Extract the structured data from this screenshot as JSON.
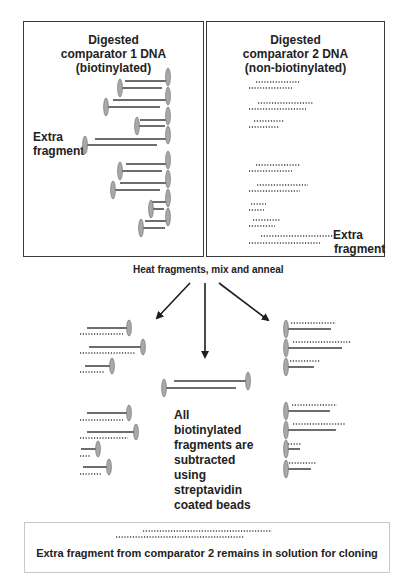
{
  "panels": {
    "left": {
      "title_lines": [
        "Digested",
        "comparator 1 DNA",
        "(biotinylated)"
      ],
      "side_label_lines": [
        "Extra",
        "fragment"
      ]
    },
    "right": {
      "title_lines": [
        "Digested",
        "comparator 2 DNA",
        "(non-biotinylated)"
      ],
      "side_label_lines": [
        "Extra",
        "fragment"
      ]
    }
  },
  "step_caption": "Heat fragments, mix and anneal",
  "subtraction_note_lines": [
    "All",
    "biotinylated",
    "fragments are",
    "subtracted",
    "using",
    "streptavidin",
    "coated beads"
  ],
  "result_caption": "Extra fragment from comparator 2 remains in solution for cloning",
  "colors": {
    "solid_strand": "#3c3c3c",
    "dotted_strand": "#444444",
    "biotin_bead": "#a8a8a8",
    "bead_outline": "#6a6a6a",
    "panel_border": "#3a3a3a",
    "result_border": "#c8c8c8",
    "arrow": "#1e1e1e"
  },
  "legend_semantics": {
    "solid_line_with_oval": "biotinylated DNA fragment (comparator 1)",
    "dotted_line": "non-biotinylated DNA fragment (comparator 2)"
  },
  "geometry": {
    "left_panel_fragments": [
      {
        "x1": 125,
        "x2": 168,
        "y": 81,
        "bead": "right"
      },
      {
        "x1": 120,
        "x2": 162,
        "y": 88,
        "bead": "left"
      },
      {
        "x1": 113,
        "x2": 168,
        "y": 100,
        "bead": "right"
      },
      {
        "x1": 106,
        "x2": 160,
        "y": 107,
        "bead": "left"
      },
      {
        "x1": 140,
        "x2": 168,
        "y": 120,
        "bead": "right"
      },
      {
        "x1": 137,
        "x2": 165,
        "y": 126,
        "bead": "left"
      },
      {
        "x1": 95,
        "x2": 168,
        "y": 139,
        "bead": "right"
      },
      {
        "x1": 85,
        "x2": 157,
        "y": 145,
        "bead": "left"
      },
      {
        "x1": 126,
        "x2": 168,
        "y": 164,
        "bead": "right"
      },
      {
        "x1": 120,
        "x2": 162,
        "y": 171,
        "bead": "left"
      },
      {
        "x1": 120,
        "x2": 168,
        "y": 183,
        "bead": "right"
      },
      {
        "x1": 113,
        "x2": 160,
        "y": 190,
        "bead": "left"
      },
      {
        "x1": 151,
        "x2": 168,
        "y": 202,
        "bead": "right"
      },
      {
        "x1": 151,
        "x2": 164,
        "y": 209,
        "bead": "left"
      },
      {
        "x1": 145,
        "x2": 168,
        "y": 221,
        "bead": "right"
      },
      {
        "x1": 141,
        "x2": 165,
        "y": 228,
        "bead": "left"
      }
    ],
    "right_panel_dotted": [
      {
        "x1": 256,
        "x2": 300,
        "y": 82
      },
      {
        "x1": 249,
        "x2": 292,
        "y": 88
      },
      {
        "x1": 258,
        "x2": 314,
        "y": 103
      },
      {
        "x1": 249,
        "x2": 306,
        "y": 109
      },
      {
        "x1": 254,
        "x2": 284,
        "y": 121
      },
      {
        "x1": 249,
        "x2": 279,
        "y": 127
      },
      {
        "x1": 256,
        "x2": 300,
        "y": 165
      },
      {
        "x1": 249,
        "x2": 292,
        "y": 171
      },
      {
        "x1": 257,
        "x2": 308,
        "y": 185
      },
      {
        "x1": 249,
        "x2": 300,
        "y": 191
      },
      {
        "x1": 251,
        "x2": 266,
        "y": 204
      },
      {
        "x1": 249,
        "x2": 264,
        "y": 210
      },
      {
        "x1": 253,
        "x2": 280,
        "y": 220
      },
      {
        "x1": 249,
        "x2": 275,
        "y": 226
      },
      {
        "x1": 261,
        "x2": 333,
        "y": 236
      },
      {
        "x1": 249,
        "x2": 320,
        "y": 243
      }
    ],
    "hybrid_left": [
      {
        "solid": [
          87,
          128,
          328
        ],
        "dotted": [
          80,
          123,
          334
        ],
        "beadX": 129,
        "beadY": 328
      },
      {
        "solid": [
          89,
          142,
          347
        ],
        "dotted": [
          80,
          136,
          353
        ],
        "beadX": 143,
        "beadY": 347
      },
      {
        "solid": [
          85,
          111,
          366
        ],
        "dotted": [
          80,
          104,
          372
        ],
        "beadX": 112,
        "beadY": 366
      },
      {
        "solid": [
          87,
          128,
          413
        ],
        "dotted": [
          80,
          123,
          420
        ],
        "beadX": 129,
        "beadY": 413
      },
      {
        "solid": [
          87,
          135,
          432
        ],
        "dotted": [
          80,
          128,
          438
        ],
        "beadX": 136,
        "beadY": 432
      },
      {
        "solid": [
          81,
          97,
          449
        ],
        "dotted": [
          80,
          90,
          456
        ],
        "beadX": 98,
        "beadY": 449
      },
      {
        "solid": [
          83,
          108,
          467
        ],
        "dotted": [
          80,
          101,
          474
        ],
        "beadX": 109,
        "beadY": 467
      }
    ],
    "center_duplex": {
      "top": [
        174,
        246,
        381
      ],
      "bottom": [
        166,
        236,
        388
      ],
      "beadR": [
        248,
        381
      ],
      "beadL": [
        164,
        388
      ]
    },
    "hybrid_right": [
      {
        "dotted": [
          291,
          336,
          323
        ],
        "solid": [
          288,
          331,
          329
        ],
        "beadX": 286,
        "beadY": 329
      },
      {
        "dotted": [
          293,
          351,
          342
        ],
        "solid": [
          288,
          342,
          348
        ],
        "beadX": 286,
        "beadY": 348
      },
      {
        "dotted": [
          290,
          320,
          361
        ],
        "solid": [
          288,
          314,
          367
        ],
        "beadX": 286,
        "beadY": 367
      },
      {
        "dotted": [
          292,
          337,
          405
        ],
        "solid": [
          288,
          330,
          411
        ],
        "beadX": 286,
        "beadY": 411
      },
      {
        "dotted": [
          293,
          345,
          424
        ],
        "solid": [
          288,
          336,
          430
        ],
        "beadX": 286,
        "beadY": 430
      },
      {
        "dotted": [
          288,
          302,
          444
        ],
        "solid": [
          288,
          300,
          449
        ],
        "beadX": 286,
        "beadY": 449
      },
      {
        "dotted": [
          289,
          316,
          463
        ],
        "solid": [
          288,
          311,
          469
        ],
        "beadX": 286,
        "beadY": 469
      }
    ],
    "result_dotted": [
      {
        "x1": 143,
        "x2": 272,
        "y": 531
      },
      {
        "x1": 116,
        "x2": 244,
        "y": 537
      }
    ]
  }
}
